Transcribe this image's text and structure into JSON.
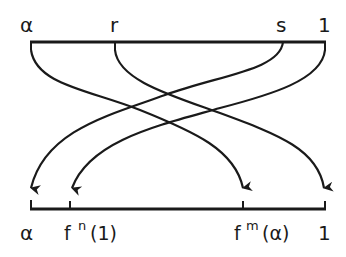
{
  "diagram": {
    "type": "interval-map",
    "top_axis": {
      "labels": [
        "α",
        "r",
        "s",
        "1"
      ]
    },
    "bottom_axis": {
      "labels": [
        "α",
        "f",
        "n",
        "(1)",
        "f",
        "m",
        "(α)",
        "1"
      ],
      "display": [
        "α",
        "fⁿ(1)",
        "fᵐ(α)",
        "1"
      ]
    },
    "arrows": [
      {
        "from": "α",
        "to": "fᵐ(α)"
      },
      {
        "from": "r",
        "to": "1"
      },
      {
        "from": "s",
        "to": "α"
      },
      {
        "from": "1",
        "to": "fⁿ(1)"
      }
    ],
    "line_color": "#1a1a1a"
  }
}
